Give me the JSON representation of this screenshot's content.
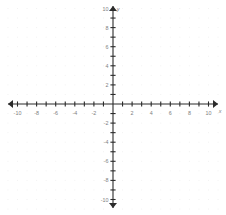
{
  "figure": {
    "kind": "cartesian-coordinate-plane",
    "width": 226,
    "height": 215,
    "background_color": "#ffffff",
    "axis_color": "#2b2b2b",
    "tick_color": "#2b2b2b",
    "label_color": "#808080",
    "grid_dot_color": "#f2f2f2"
  },
  "axis_titles": {
    "x": "x",
    "y": "y"
  },
  "chart_data": {
    "type": "scatter",
    "title": "",
    "subtitle": "",
    "xlabel": "x",
    "ylabel": "y",
    "xlim": [
      -11,
      11
    ],
    "ylim": [
      -11,
      11
    ],
    "grid": true,
    "grid_style": "dotted",
    "grid_spacing": 1,
    "legend": false,
    "legend_position": "none",
    "series": [],
    "x": [],
    "y": [],
    "xticks": [
      -11,
      -10,
      -9,
      -8,
      -7,
      -6,
      -5,
      -4,
      -3,
      -2,
      -1,
      0,
      1,
      2,
      3,
      4,
      5,
      6,
      7,
      8,
      9,
      10,
      11
    ],
    "yticks": [
      -11,
      -10,
      -9,
      -8,
      -7,
      -6,
      -5,
      -4,
      -3,
      -2,
      -1,
      0,
      1,
      2,
      3,
      4,
      5,
      6,
      7,
      8,
      9,
      10,
      11
    ],
    "xtick_labels": [
      {
        "value": -10,
        "text": "-10"
      },
      {
        "value": -8,
        "text": "-8"
      },
      {
        "value": -6,
        "text": "-6"
      },
      {
        "value": -4,
        "text": "-4"
      },
      {
        "value": -2,
        "text": "-2"
      },
      {
        "value": 2,
        "text": "2"
      },
      {
        "value": 4,
        "text": "4"
      },
      {
        "value": 6,
        "text": "6"
      },
      {
        "value": 8,
        "text": "8"
      },
      {
        "value": 10,
        "text": "10"
      }
    ],
    "ytick_labels": [
      {
        "value": 10,
        "text": "10"
      },
      {
        "value": 8,
        "text": "8"
      },
      {
        "value": 6,
        "text": "6"
      },
      {
        "value": 4,
        "text": "4"
      },
      {
        "value": 2,
        "text": "2"
      },
      {
        "value": -2,
        "text": "-2"
      },
      {
        "value": -4,
        "text": "-4"
      },
      {
        "value": -6,
        "text": "-6"
      },
      {
        "value": -8,
        "text": "-8"
      },
      {
        "value": -10,
        "text": "-10"
      }
    ],
    "origin_label": ""
  },
  "geometry": {
    "origin_x": 113,
    "origin_y": 104,
    "unit_px": 9.55,
    "x_axis_start": 8,
    "x_axis_end": 218,
    "y_axis_start": 6,
    "y_axis_end": 208,
    "tick_half_len": 2.6,
    "arrow_size": 4
  }
}
